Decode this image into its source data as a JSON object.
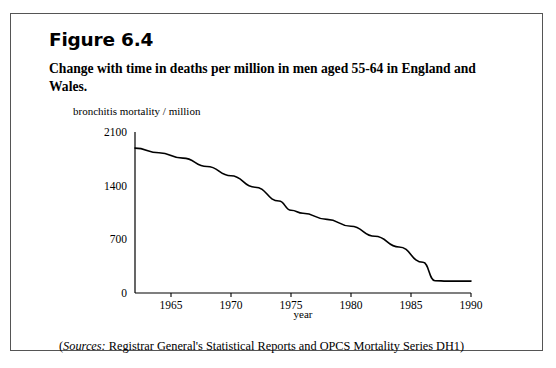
{
  "figure": {
    "number_label": "Figure 6.4",
    "caption": "Change with time in deaths per million in men aged 55-64 in England and Wales.",
    "source_label": "Sources:",
    "source_text": " Registrar General's Statistical Reports and OPCS Mortality Series DH1)",
    "source_open_paren": "(",
    "border_color": "#555555",
    "line_color": "#000000"
  },
  "chart_data": {
    "type": "line",
    "title": "Change with time in deaths per million in men aged 55-64 in England and Wales.",
    "subtitle": "",
    "xlabel": "year",
    "ylabel": "bronchitis mortality / million",
    "xlim": [
      1962,
      1990
    ],
    "ylim": [
      0,
      2100
    ],
    "xticks": [
      1965,
      1970,
      1975,
      1980,
      1985,
      1990
    ],
    "xtick_labels": [
      "1965",
      "1970",
      "1975",
      "1980",
      "1985",
      "1990"
    ],
    "yticks": [
      0,
      700,
      1400,
      2100
    ],
    "ytick_labels": [
      "0",
      "700",
      "1400",
      "2100"
    ],
    "grid": false,
    "legend": null,
    "series": [
      {
        "name": "bronchitis mortality in men aged 55-64",
        "x": [
          1962,
          1964,
          1966,
          1968,
          1970,
          1972,
          1974,
          1975,
          1976,
          1978,
          1980,
          1982,
          1984,
          1986,
          1987,
          1988,
          1990
        ],
        "values": [
          1890,
          1830,
          1760,
          1650,
          1530,
          1380,
          1200,
          1080,
          1040,
          960,
          870,
          740,
          600,
          400,
          160,
          155,
          155
        ]
      }
    ],
    "annotations": []
  }
}
